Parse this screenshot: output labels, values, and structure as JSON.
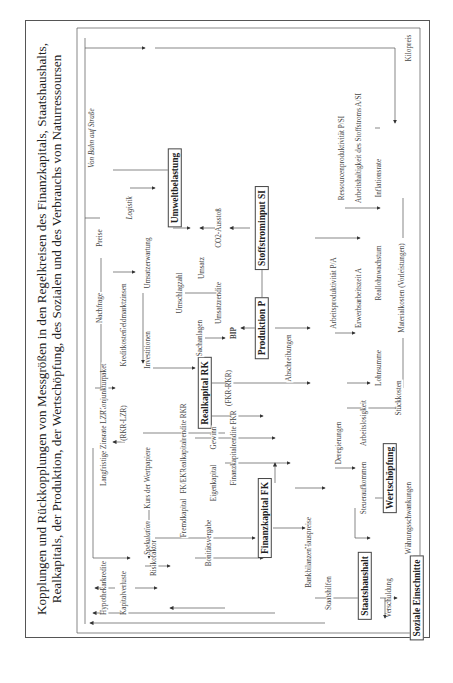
{
  "title": {
    "line1": "Kopplungen und Rückkopplungen von Messgrößen in den Regelkreisen des Finanzkapitals, Staatshaushalts,",
    "line2": "Realkapitals, der Produktion, der Wertschöpfung, des Sozialen und des Verbrauchs von Naturressoursen"
  },
  "boxes": {
    "umweltbelastung": "Umweltbelastung",
    "stoffstrominput": "Stoffstrominput SI",
    "produktion": "Produktion P",
    "realkapital": "Realkapital RK",
    "finanzkapital": "Finanzkapital FK",
    "wertschoepfung": "Wertschöpfung",
    "staatshaushalt": "Staatshaushalt",
    "soziale_einschnitte": "Soziale Einschnitte"
  },
  "labels": {
    "von_bahn": "Von Bahn auf Straße",
    "logistik": "Logistik",
    "co2": "CO2-Ausstoß",
    "preise": "Preise",
    "nachfrage": "Nachfrage",
    "geldmarktzinsen": "Geldmarktzinsen",
    "umsatzerwartung": "Umsatzerwartung",
    "umschlagzahl": "Umschlagzahl",
    "umsatz": "Umsatz",
    "umsatzrendite": "Umsatzrendite",
    "bip": "BIP",
    "kreditkosten": "Kreditkosten",
    "investitionen": "Investitionen",
    "konjunkturpaket": "Konjunkturpaket",
    "sachanlagen": "Sachanlagen",
    "abschreibungen": "Abschreibungen",
    "rkr_lzr": "(RKR-LZR)",
    "langfristige_zinsen": "Langfristige Zinsrate LZR",
    "kurs_wertpapiere": "Kurs der Wertpapiere",
    "realkapitalrendite": "Realkapitalrendite RKR",
    "gewinn": "Gewinn",
    "fkr_rkr": "(FKR-RKR)",
    "finanzkapitalrendite": "Finanzkapitalrendite FKR",
    "fk_ek": "FK/EK",
    "eigenkapital": "Eigenkapital",
    "fremdkapital": "Fremdkapital",
    "bonitaetsvergabe": "Bonitätsvergabe",
    "spekulation": "Spekulation",
    "hypothekarkredite": "Hypothekarkredite",
    "kapitalverluste": "Kapitalverluste",
    "risikofaktor": "Risikofaktor",
    "hauspreise": "Hauspreise",
    "bankbilanzen": "Bankbilanzen",
    "staatshilfen": "Staatshilfen",
    "verschuldung": "Verschuldung",
    "deregierungen": "Deregierungen",
    "steueraufkommen": "Steueraufkommen",
    "arbeitslosigkeit": "Arbeitslosigkeit",
    "waehrungsschwankungen": "Währungsschwankungen",
    "stueckkosten": "Stückkosten",
    "lohnsumme": "Lohnsumme",
    "erwerbsarbeitszeit": "Erwerbsarbeitszeit A",
    "reallohnwachstum": "Reallohnwachstum",
    "arbeitsproduktivitaet": "Arbeitsproduktivität P/A",
    "materialkosten": "Materialkosten (Vorleistungen)",
    "inflationsrate": "Inflationsrate",
    "ressourcenproduktivitaet": "Ressourcenproduktivität P/SI",
    "arbeitshaltigkeit": "Arbeitshaltigkeit des Stoffstroms A/SI",
    "kilopreis": "Kilopreis"
  }
}
